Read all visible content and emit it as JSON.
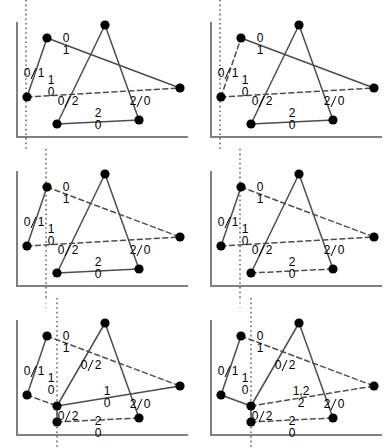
{
  "figure": {
    "panel_count": 6,
    "rows": 3,
    "cols": 2,
    "colors": {
      "axis": "#808080",
      "edge": "#4d4d4d",
      "vertex": "#000000",
      "sweepline": "#555555",
      "label": "#000000",
      "background": "#ffffff"
    },
    "geometry": {
      "axis_x": 17,
      "axis_y": 137,
      "axis_top": 22,
      "axis_right": 188,
      "vertices": {
        "a": [
          27,
          97
        ],
        "b": [
          47,
          38
        ],
        "c": [
          105,
          25
        ],
        "d": [
          57,
          124
        ],
        "e": [
          139,
          120
        ],
        "f": [
          180,
          88
        ],
        "g": [
          57,
          108
        ]
      },
      "vertex_radius": 4.6
    }
  },
  "panels": [
    {
      "id": "panel-1",
      "position": "top-left",
      "sweep_x": 26,
      "sweep_extends_below": true,
      "sweep_extends_above": true,
      "has_extra_vertex": false,
      "edges": [
        {
          "name": "a-b",
          "from": "a",
          "to": "b",
          "style": "solid"
        },
        {
          "name": "b-f",
          "from": "b",
          "to": "f",
          "style": "solid"
        },
        {
          "name": "a-f",
          "from": "a",
          "to": "f",
          "style": "dashed"
        },
        {
          "name": "d-c",
          "from": "d",
          "to": "c",
          "style": "solid"
        },
        {
          "name": "c-e",
          "from": "c",
          "to": "e",
          "style": "solid"
        },
        {
          "name": "d-e",
          "from": "d",
          "to": "e",
          "style": "solid"
        }
      ],
      "labels": [
        {
          "name": "label-ab",
          "x": 27,
          "y": 77,
          "top": "0",
          "bottom": "",
          "slash": true,
          "right": "1"
        },
        {
          "name": "label-bf",
          "x": 66,
          "y": 47,
          "top": "0",
          "bottom": "1"
        },
        {
          "name": "label-af",
          "x": 51,
          "y": 89,
          "top": "1",
          "bottom": "0"
        },
        {
          "name": "label-dc",
          "x": 61,
          "y": 105,
          "top": "0",
          "bottom": "",
          "slash": true,
          "right": "2"
        },
        {
          "name": "label-de",
          "x": 98,
          "y": 122,
          "top": "2",
          "bottom": "0"
        },
        {
          "name": "label-ce",
          "x": 133,
          "y": 105,
          "top": "2",
          "bottom": "",
          "slash": true,
          "right": "0"
        }
      ]
    },
    {
      "id": "panel-2",
      "position": "top-right",
      "sweep_x": 26,
      "sweep_extends_below": true,
      "sweep_extends_above": true,
      "has_extra_vertex": false,
      "edges": [
        {
          "name": "a-b",
          "from": "a",
          "to": "b",
          "style": "dashed"
        },
        {
          "name": "b-f",
          "from": "b",
          "to": "f",
          "style": "solid"
        },
        {
          "name": "a-f",
          "from": "a",
          "to": "f",
          "style": "dashed"
        },
        {
          "name": "d-c",
          "from": "d",
          "to": "c",
          "style": "solid"
        },
        {
          "name": "c-e",
          "from": "c",
          "to": "e",
          "style": "solid"
        },
        {
          "name": "d-e",
          "from": "d",
          "to": "e",
          "style": "solid"
        }
      ],
      "labels": [
        {
          "name": "label-ab",
          "x": 27,
          "y": 77,
          "top": "0",
          "bottom": "",
          "slash": true,
          "right": "1"
        },
        {
          "name": "label-bf",
          "x": 66,
          "y": 47,
          "top": "0",
          "bottom": "1"
        },
        {
          "name": "label-af",
          "x": 51,
          "y": 89,
          "top": "1",
          "bottom": "0"
        },
        {
          "name": "label-dc",
          "x": 61,
          "y": 105,
          "top": "0",
          "bottom": "",
          "slash": true,
          "right": "2"
        },
        {
          "name": "label-de",
          "x": 98,
          "y": 122,
          "top": "2",
          "bottom": "0"
        },
        {
          "name": "label-ce",
          "x": 133,
          "y": 105,
          "top": "2",
          "bottom": "",
          "slash": true,
          "right": "0"
        }
      ]
    },
    {
      "id": "panel-3",
      "position": "middle-left",
      "sweep_x": 46,
      "sweep_extends_below": true,
      "sweep_extends_above": true,
      "has_extra_vertex": false,
      "edges": [
        {
          "name": "a-b",
          "from": "a",
          "to": "b",
          "style": "solid"
        },
        {
          "name": "b-f",
          "from": "b",
          "to": "f",
          "style": "dashed"
        },
        {
          "name": "a-f",
          "from": "a",
          "to": "f",
          "style": "dashed"
        },
        {
          "name": "d-c",
          "from": "d",
          "to": "c",
          "style": "solid"
        },
        {
          "name": "c-e",
          "from": "c",
          "to": "e",
          "style": "solid"
        },
        {
          "name": "d-e",
          "from": "d",
          "to": "e",
          "style": "solid"
        }
      ],
      "labels": [
        {
          "name": "label-ab",
          "x": 27,
          "y": 77,
          "top": "0",
          "bottom": "",
          "slash": true,
          "right": "1"
        },
        {
          "name": "label-bf",
          "x": 66,
          "y": 47,
          "top": "0",
          "bottom": "1"
        },
        {
          "name": "label-af",
          "x": 51,
          "y": 89,
          "top": "1",
          "bottom": "0"
        },
        {
          "name": "label-dc",
          "x": 61,
          "y": 105,
          "top": "0",
          "bottom": "",
          "slash": true,
          "right": "2"
        },
        {
          "name": "label-de",
          "x": 98,
          "y": 122,
          "top": "2",
          "bottom": "0"
        },
        {
          "name": "label-ce",
          "x": 133,
          "y": 105,
          "top": "2",
          "bottom": "",
          "slash": true,
          "right": "0"
        }
      ]
    },
    {
      "id": "panel-4",
      "position": "middle-right",
      "sweep_x": 46,
      "sweep_extends_below": true,
      "sweep_extends_above": true,
      "has_extra_vertex": false,
      "edges": [
        {
          "name": "a-b",
          "from": "a",
          "to": "b",
          "style": "solid"
        },
        {
          "name": "b-f",
          "from": "b",
          "to": "f",
          "style": "dashed"
        },
        {
          "name": "a-f",
          "from": "a",
          "to": "f",
          "style": "dashed"
        },
        {
          "name": "d-c",
          "from": "d",
          "to": "c",
          "style": "solid"
        },
        {
          "name": "c-e",
          "from": "c",
          "to": "e",
          "style": "solid"
        },
        {
          "name": "d-e",
          "from": "d",
          "to": "e",
          "style": "dashed"
        }
      ],
      "labels": [
        {
          "name": "label-ab",
          "x": 27,
          "y": 77,
          "top": "0",
          "bottom": "",
          "slash": true,
          "right": "1"
        },
        {
          "name": "label-bf",
          "x": 66,
          "y": 47,
          "top": "0",
          "bottom": "1"
        },
        {
          "name": "label-af",
          "x": 51,
          "y": 89,
          "top": "1",
          "bottom": "0"
        },
        {
          "name": "label-dc",
          "x": 61,
          "y": 105,
          "top": "0",
          "bottom": "",
          "slash": true,
          "right": "2"
        },
        {
          "name": "label-de",
          "x": 98,
          "y": 122,
          "top": "2",
          "bottom": "0"
        },
        {
          "name": "label-ce",
          "x": 133,
          "y": 105,
          "top": "2",
          "bottom": "",
          "slash": true,
          "right": "0"
        }
      ]
    },
    {
      "id": "panel-5",
      "position": "bottom-left",
      "sweep_x": 57,
      "sweep_extends_below": true,
      "sweep_extends_above": true,
      "ghost_sweep_x": 46,
      "has_extra_vertex": true,
      "edges": [
        {
          "name": "a-b",
          "from": "a",
          "to": "b",
          "style": "solid"
        },
        {
          "name": "b-f",
          "from": "b",
          "to": "f",
          "style": "dashed"
        },
        {
          "name": "a-g",
          "from": "a",
          "to": "g",
          "style": "dashed"
        },
        {
          "name": "g-f",
          "from": "g",
          "to": "f",
          "style": "solid"
        },
        {
          "name": "d-g",
          "from": "d",
          "to": "g",
          "style": "solid"
        },
        {
          "name": "g-c",
          "from": "g",
          "to": "c",
          "style": "solid"
        },
        {
          "name": "c-e",
          "from": "c",
          "to": "e",
          "style": "solid"
        },
        {
          "name": "d-e",
          "from": "d",
          "to": "e",
          "style": "dashed"
        }
      ],
      "labels": [
        {
          "name": "label-ab",
          "x": 27,
          "y": 77,
          "top": "0",
          "bottom": "",
          "slash": true,
          "right": "1"
        },
        {
          "name": "label-bf",
          "x": 66,
          "y": 47,
          "top": "0",
          "bottom": "1"
        },
        {
          "name": "label-ag",
          "x": 51,
          "y": 89,
          "top": "1",
          "bottom": "0"
        },
        {
          "name": "label-gc",
          "x": 84,
          "y": 71,
          "top": "0",
          "bottom": "",
          "slash": true,
          "right": "2"
        },
        {
          "name": "label-gf",
          "x": 107,
          "y": 102,
          "top": "1",
          "bottom": "0"
        },
        {
          "name": "label-dg",
          "x": 61,
          "y": 122,
          "top": "0",
          "bottom": "",
          "slash": true,
          "right": "2"
        },
        {
          "name": "label-de",
          "x": 98,
          "y": 132,
          "top": "2",
          "bottom": "0"
        },
        {
          "name": "label-ce",
          "x": 133,
          "y": 110,
          "top": "2",
          "bottom": "",
          "slash": true,
          "right": "0"
        }
      ]
    },
    {
      "id": "panel-6",
      "position": "bottom-right",
      "sweep_x": 57,
      "sweep_extends_below": true,
      "sweep_extends_above": true,
      "ghost_sweep_x": 46,
      "has_extra_vertex": true,
      "edges": [
        {
          "name": "a-b",
          "from": "a",
          "to": "b",
          "style": "solid"
        },
        {
          "name": "b-f",
          "from": "b",
          "to": "f",
          "style": "dashed"
        },
        {
          "name": "a-g",
          "from": "a",
          "to": "g",
          "style": "solid"
        },
        {
          "name": "g-f",
          "from": "g",
          "to": "f",
          "style": "dashed"
        },
        {
          "name": "d-g",
          "from": "d",
          "to": "g",
          "style": "solid"
        },
        {
          "name": "g-c",
          "from": "g",
          "to": "c",
          "style": "solid"
        },
        {
          "name": "c-e",
          "from": "c",
          "to": "e",
          "style": "solid"
        },
        {
          "name": "d-e",
          "from": "d",
          "to": "e",
          "style": "dashed"
        }
      ],
      "labels": [
        {
          "name": "label-ab",
          "x": 27,
          "y": 77,
          "top": "0",
          "bottom": "",
          "slash": true,
          "right": "1"
        },
        {
          "name": "label-bf",
          "x": 66,
          "y": 47,
          "top": "0",
          "bottom": "1"
        },
        {
          "name": "label-ag",
          "x": 51,
          "y": 89,
          "top": "1",
          "bottom": "0"
        },
        {
          "name": "label-gc",
          "x": 84,
          "y": 71,
          "top": "0",
          "bottom": "",
          "slash": true,
          "right": "2"
        },
        {
          "name": "label-gf",
          "x": 107,
          "y": 102,
          "top": "1,2",
          "bottom": "2"
        },
        {
          "name": "label-dg",
          "x": 61,
          "y": 122,
          "top": "0",
          "bottom": "",
          "slash": true,
          "right": "2"
        },
        {
          "name": "label-de",
          "x": 98,
          "y": 132,
          "top": "2",
          "bottom": "0"
        },
        {
          "name": "label-ce",
          "x": 133,
          "y": 110,
          "top": "2",
          "bottom": "",
          "slash": true,
          "right": "0"
        }
      ]
    }
  ]
}
